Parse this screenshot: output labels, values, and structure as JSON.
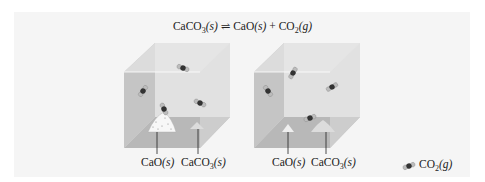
{
  "equation": {
    "reactant": "CaCO",
    "reactant_sub": "3",
    "reactant_state": "(s)",
    "arrow": "⇌",
    "product1": "CaO",
    "product1_state": "(s)",
    "plus": "+",
    "product2": "CO",
    "product2_sub": "2",
    "product2_state": "(g)"
  },
  "containers": [
    {
      "labels": [
        {
          "formula": "CaO",
          "sub": "",
          "state": "(s)"
        },
        {
          "formula": "CaCO",
          "sub": "3",
          "state": "(s)"
        }
      ],
      "co2_molecule_count": 4,
      "cao_pile": "large",
      "caco3_pile": "small"
    },
    {
      "labels": [
        {
          "formula": "CaO",
          "sub": "",
          "state": "(s)"
        },
        {
          "formula": "CaCO",
          "sub": "3",
          "state": "(s)"
        }
      ],
      "co2_molecule_count": 4,
      "cao_pile": "small",
      "caco3_pile": "large"
    }
  ],
  "legend": {
    "icon": "co2-molecule-icon",
    "formula": "CO",
    "sub": "2",
    "state": "(g)"
  },
  "colors": {
    "panel": "#f5f5f5",
    "box_side": "#bdbdbd",
    "box_floor": "#a8a8a8",
    "box_top": "#e6e6e6",
    "carbon": "#333333",
    "oxygen": "#bcbcbc"
  }
}
